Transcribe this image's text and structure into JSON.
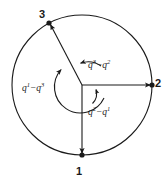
{
  "figure": {
    "background_color": "#ffffff",
    "stroke_color": "#1a1a1a",
    "width": 166,
    "height": 181,
    "circle": {
      "center_x": 82,
      "center_y": 85,
      "radius": 70,
      "label": "outer-circle"
    },
    "inner_arc_radius": 26,
    "points": [
      {
        "id": "1",
        "label": "1",
        "angle_deg": 270,
        "position": "bottom",
        "x": 82,
        "y": 155,
        "marker": "filled-dot"
      },
      {
        "id": "2",
        "label": "2",
        "angle_deg": 0,
        "position": "right",
        "x": 152,
        "y": 85,
        "marker": "filled-dot"
      },
      {
        "id": "3",
        "label": "3",
        "angle_deg": 118,
        "position": "upper-left",
        "x": 49,
        "y": 23,
        "marker": "filled-dot"
      }
    ],
    "arc_labels": [
      {
        "id": "q3-minus-q2",
        "base": "q",
        "sup_left": "3",
        "operator": "−",
        "sup_right": "2",
        "text": "q³−q²",
        "region": "upper-right-interior"
      },
      {
        "id": "q1-minus-q3",
        "base": "q",
        "sup_left": "1",
        "operator": "−",
        "sup_right": "3",
        "text": "q¹−q³",
        "region": "left-interior"
      },
      {
        "id": "q2-minus-q1",
        "base": "q",
        "sup_left": "2",
        "operator": "−",
        "sup_right": "1",
        "text": "q²−q¹",
        "region": "lower-right-interior"
      }
    ]
  }
}
